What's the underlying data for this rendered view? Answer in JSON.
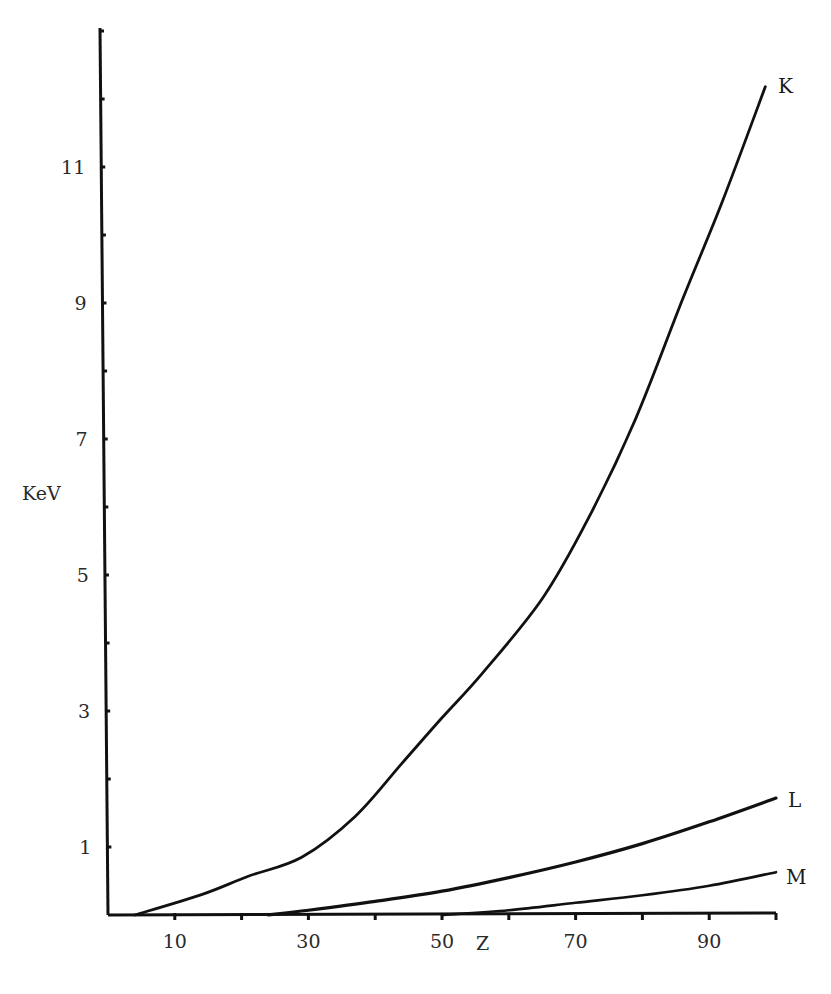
{
  "chart_data": {
    "type": "line",
    "title": "",
    "xlabel": "Z",
    "ylabel": "KeV",
    "xlim": [
      0,
      100
    ],
    "ylim": [
      0,
      13
    ],
    "grid": false,
    "legend": "inline labels at curve ends",
    "x_ticks": [
      10,
      20,
      30,
      40,
      50,
      60,
      70,
      80,
      90,
      100
    ],
    "x_tick_labels": [
      "10",
      "30",
      "50",
      "70",
      "90"
    ],
    "x_tick_label_values": [
      10,
      30,
      50,
      70,
      90
    ],
    "y_ticks": [
      1,
      2,
      3,
      4,
      5,
      6,
      7,
      8,
      9,
      10,
      11,
      12,
      13
    ],
    "y_tick_labels": [
      "1",
      "3",
      "5",
      "7",
      "9",
      "11"
    ],
    "y_tick_label_values": [
      1,
      3,
      5,
      7,
      9,
      11
    ],
    "series": [
      {
        "name": "K",
        "x": [
          4,
          14,
          21,
          29,
          37,
          44,
          50,
          56,
          65,
          72,
          79,
          86,
          92,
          98.4
        ],
        "values": [
          0,
          0.3,
          0.57,
          0.85,
          1.45,
          2.23,
          2.9,
          3.55,
          4.65,
          5.85,
          7.3,
          9.05,
          10.5,
          12.18
        ]
      },
      {
        "name": "L",
        "x": [
          24,
          30,
          40,
          50,
          60,
          70,
          80,
          90,
          100
        ],
        "values": [
          0,
          0.07,
          0.2,
          0.35,
          0.55,
          0.78,
          1.05,
          1.37,
          1.72
        ]
      },
      {
        "name": "M",
        "x": [
          50,
          60,
          70,
          80,
          90,
          100
        ],
        "values": [
          0,
          0.07,
          0.18,
          0.29,
          0.43,
          0.63
        ]
      }
    ]
  },
  "labels": {
    "x_axis": "Z",
    "y_axis": "KeV",
    "curve_k": "K",
    "curve_l": "L",
    "curve_m": "M"
  }
}
